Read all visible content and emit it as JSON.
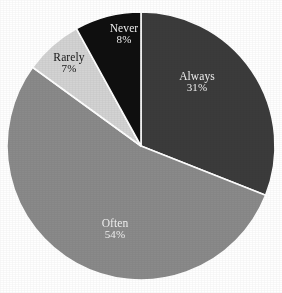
{
  "chart_data": {
    "type": "pie",
    "title": "",
    "subtitle": "",
    "xlabel": "",
    "ylabel": "",
    "legend": "none",
    "grid": false,
    "labels_inside_slices": true,
    "start_angle_deg": 0,
    "direction": "clockwise",
    "categories": [
      "Always",
      "Often",
      "Rarely",
      "Never"
    ],
    "values": [
      31,
      54,
      7,
      8
    ],
    "value_unit": "%",
    "slices": [
      {
        "label": "Always",
        "value": 31,
        "value_text": "31%",
        "color": "#3b3b3b",
        "text_color": "#f2f2f2"
      },
      {
        "label": "Often",
        "value": 54,
        "value_text": "54%",
        "color": "#8a8a8a",
        "text_color": "#f2f2f2"
      },
      {
        "label": "Rarely",
        "value": 7,
        "value_text": "7%",
        "color": "#d3d3d3",
        "text_color": "#161616"
      },
      {
        "label": "Never",
        "value": 8,
        "value_text": "8%",
        "color": "#0f0f0f",
        "text_color": "#f2f2f2"
      }
    ],
    "geometry": {
      "center_x": 141,
      "center_y": 146,
      "radius": 134,
      "separator_color": "#ffffff",
      "separator_width": 1.6
    },
    "background_color": "#ffffff"
  }
}
